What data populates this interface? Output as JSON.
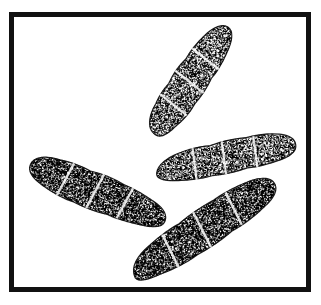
{
  "figure": {
    "frame_color": "#111111",
    "ink_color": "#1a1a1a",
    "background_color": "#ffffff",
    "spores": [
      {
        "name": "top-spore",
        "septa": 3
      },
      {
        "name": "left-spore",
        "septa": 3
      },
      {
        "name": "right-spore",
        "septa": 3
      },
      {
        "name": "bottom-spore",
        "septa": 3
      }
    ]
  }
}
